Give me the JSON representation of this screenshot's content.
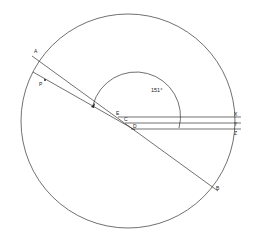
{
  "diagram": {
    "type": "geometric-construction",
    "colors": {
      "stroke": "#333333",
      "background": "#ffffff"
    },
    "circle": {
      "cx": 128,
      "cy": 121,
      "r": 107
    },
    "points": {
      "A": "A",
      "B": "B",
      "P": "P",
      "E": "E",
      "C": "C",
      "D": "D",
      "X": "X",
      "Y": "Y",
      "Z": "Z"
    },
    "angle_label": "151°",
    "lines": [
      {
        "name": "AB",
        "from": [
          32,
          56
        ],
        "to": [
          218,
          191
        ]
      },
      {
        "name": "P-line",
        "from": [
          33,
          72
        ],
        "to": [
          135,
          130
        ]
      },
      {
        "name": "EX",
        "from": [
          118,
          117
        ],
        "to": [
          241,
          117
        ]
      },
      {
        "name": "CY",
        "from": [
          125,
          123
        ],
        "to": [
          241,
          123
        ]
      },
      {
        "name": "DZ",
        "from": [
          131,
          129
        ],
        "to": [
          241,
          129
        ]
      }
    ]
  }
}
